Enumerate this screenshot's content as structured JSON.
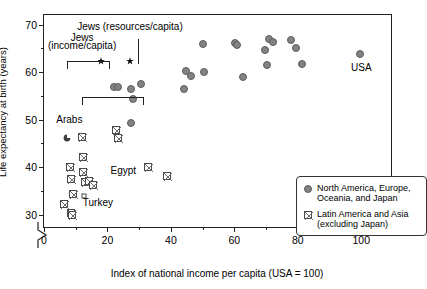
{
  "chart_data": {
    "type": "scatter",
    "title": "",
    "xlabel": "Index of national income per capita (USA = 100)",
    "ylabel": "Life expectancy at birth (years)",
    "xlim": [
      0,
      110
    ],
    "ylim": [
      27,
      72
    ],
    "xticks": [
      0,
      20,
      40,
      60,
      80,
      100
    ],
    "yticks": [
      30,
      40,
      50,
      60,
      70
    ],
    "xminorticks": [
      10,
      30,
      50,
      70,
      90
    ],
    "yminorticks": [
      35,
      45,
      55,
      65
    ],
    "grid": false,
    "axis_break": "y-axis broken below 30",
    "legend_position": "lower right",
    "series": [
      {
        "name": "North America, Europe, Oceania, and Japan",
        "marker": "filled-circle",
        "color": "#838383",
        "points": [
          [
            22.0,
            56.8
          ],
          [
            23.3,
            56.9
          ],
          [
            27.3,
            56.4
          ],
          [
            28.0,
            54.3
          ],
          [
            30.5,
            57.4
          ],
          [
            27.5,
            49.3
          ],
          [
            44.0,
            56.5
          ],
          [
            44.8,
            60.2
          ],
          [
            46.3,
            59.2
          ],
          [
            50.2,
            66.0
          ],
          [
            50.5,
            60.1
          ],
          [
            60.3,
            66.2
          ],
          [
            60.8,
            65.6
          ],
          [
            62.8,
            59.0
          ],
          [
            69.8,
            64.7
          ],
          [
            70.3,
            61.4
          ],
          [
            70.8,
            66.9
          ],
          [
            72.3,
            66.4
          ],
          [
            78.0,
            66.8
          ],
          [
            79.3,
            65.1
          ],
          [
            81.3,
            61.8
          ],
          [
            99.5,
            63.9
          ]
        ]
      },
      {
        "name": "Latin America and Asia (excluding Japan)",
        "marker": "crossed-square",
        "color": "#fdfdfd",
        "points": [
          [
            8.3,
            40.0
          ],
          [
            8.5,
            37.5
          ],
          [
            9.0,
            34.4
          ],
          [
            6.2,
            32.2
          ],
          [
            8.6,
            30.3
          ],
          [
            8.7,
            29.9
          ],
          [
            12.0,
            46.3
          ],
          [
            12.2,
            42.2
          ],
          [
            12.4,
            38.9
          ],
          [
            13.0,
            36.8
          ],
          [
            14.2,
            37.0
          ],
          [
            15.4,
            36.2
          ],
          [
            22.6,
            47.9
          ],
          [
            23.4,
            46.2
          ],
          [
            32.8,
            40.1
          ],
          [
            38.9,
            38.2
          ]
        ]
      },
      {
        "name": "Turkey",
        "marker": "open-square",
        "points": [
          [
            12.6,
            34.0
          ]
        ]
      },
      {
        "name": "Arabs",
        "marker": "filled-pie",
        "points": [
          [
            7.2,
            47.5
          ]
        ]
      },
      {
        "name": "Jews (income/capita)",
        "marker": "star",
        "points": [
          [
            18.0,
            63.4
          ]
        ]
      },
      {
        "name": "Jews (resources/capita)",
        "marker": "star",
        "points": [
          [
            27.1,
            63.4
          ]
        ]
      }
    ],
    "annotations": [
      {
        "text": "Jews (resources/capita)",
        "x": 27.1,
        "y": 69.5
      },
      {
        "text": "Jews",
        "x": 12.0,
        "y": 67.2
      },
      {
        "text": "(income/capita)",
        "x": 12.0,
        "y": 65.5
      },
      {
        "text": "Arabs",
        "x": 8.0,
        "y": 50.0
      },
      {
        "text": "Egypt",
        "x": 25.0,
        "y": 39.2
      },
      {
        "text": "Turkey",
        "x": 17.0,
        "y": 32.4
      },
      {
        "text": "USA",
        "x": 100.0,
        "y": 60.8
      }
    ]
  },
  "axis": {
    "y_title": "Life expectancy at birth (years)",
    "x_title": "Index of national income per capita (USA = 100)",
    "y_labels": [
      "70",
      "60",
      "50",
      "40",
      "30"
    ],
    "x_labels": [
      "0",
      "20",
      "40",
      "60",
      "80",
      "100"
    ]
  },
  "annotations": {
    "jews_resources": "Jews (resources/capita)",
    "jews_income_line1": "Jews",
    "jews_income_line2": "(income/capita)",
    "arabs": "Arabs",
    "egypt": "Egypt",
    "turkey": "Turkey",
    "usa": "USA"
  },
  "legend": {
    "entries": [
      {
        "line1": "North America, Europe,",
        "line2": "Oceania, and Japan"
      },
      {
        "line1": "Latin America and Asia",
        "line2": "(excluding Japan)"
      }
    ]
  }
}
